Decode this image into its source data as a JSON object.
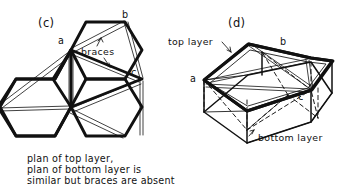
{
  "figure": {
    "background_color": "#ffffff",
    "ink_color": "#111111",
    "panels": [
      {
        "id": "c",
        "label": "(c)",
        "kind": "plan-view",
        "vertex_labels": [
          "a",
          "b",
          "c"
        ],
        "annotation": "braces",
        "caption": [
          "plan of top layer,",
          "plan of bottom layer is",
          "similar but braces are absent"
        ]
      },
      {
        "id": "d",
        "label": "(d)",
        "kind": "perspective-view",
        "vertex_labels": [
          "a",
          "b",
          "c"
        ],
        "annotations": [
          "top layer",
          "bottom layer"
        ]
      }
    ]
  },
  "panel_c": {
    "label": "(c)",
    "braces_label": "braces",
    "label_a": "a",
    "label_b": "b",
    "label_c": "c",
    "caption_line1": "plan of top layer,",
    "caption_line2": "plan of bottom layer is",
    "caption_line3": "similar but braces are absent"
  },
  "panel_d": {
    "label": "(d)",
    "top_layer_label": "top layer",
    "bottom_layer_label": "bottom layer",
    "label_a": "a",
    "label_b": "b",
    "label_c": "c"
  }
}
